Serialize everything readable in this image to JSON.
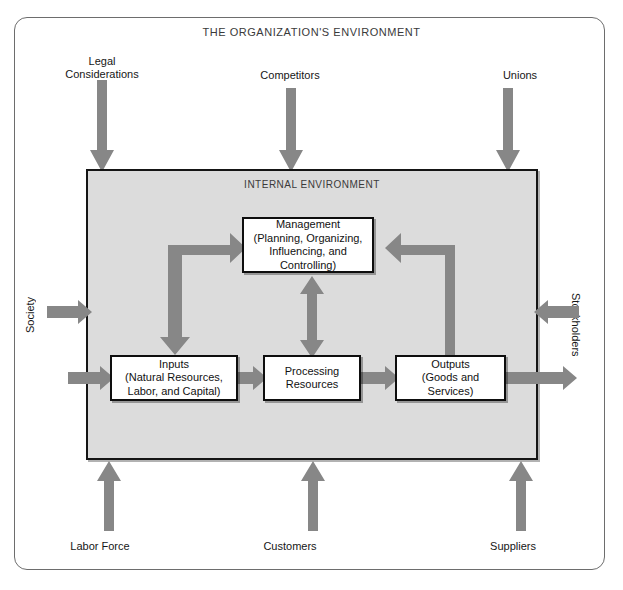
{
  "diagram": {
    "outer_title": "THE ORGANIZATION'S ENVIRONMENT",
    "internal_title": "INTERNAL ENVIRONMENT",
    "colors": {
      "arrow_gray": "#878787",
      "internal_bg": "#dcdcdc",
      "box_bg": "#ffffff",
      "border": "#0e0e0e",
      "frame_border": "#6d6d6d",
      "title_text": "#3a3a3a"
    }
  },
  "internal_boxes": [
    {
      "id": "management",
      "lines": [
        "Management",
        "(Planning, Organizing,",
        "Influencing, and",
        "Controlling)"
      ]
    },
    {
      "id": "inputs",
      "lines": [
        "Inputs",
        "(Natural Resources,",
        "Labor, and Capital)"
      ]
    },
    {
      "id": "processing",
      "lines": [
        "Processing",
        "Resources"
      ]
    },
    {
      "id": "outputs",
      "lines": [
        "Outputs",
        "(Goods and",
        "Services)"
      ]
    }
  ],
  "external_factors": {
    "top": [
      {
        "id": "legal",
        "lines": [
          "Legal",
          "Considerations"
        ],
        "direction": "down"
      },
      {
        "id": "competitors",
        "lines": [
          "Competitors"
        ],
        "direction": "down"
      },
      {
        "id": "unions",
        "lines": [
          "Unions"
        ],
        "direction": "down"
      }
    ],
    "bottom": [
      {
        "id": "labor-force",
        "lines": [
          "Labor Force"
        ],
        "direction": "up"
      },
      {
        "id": "customers",
        "lines": [
          "Customers"
        ],
        "direction": "up"
      },
      {
        "id": "suppliers",
        "lines": [
          "Suppliers"
        ],
        "direction": "up"
      }
    ],
    "left": [
      {
        "id": "society",
        "label": "Society",
        "direction": "right"
      }
    ],
    "right": [
      {
        "id": "stockholders",
        "label": "Stockholders",
        "direction": "left"
      }
    ]
  },
  "flow_arrows": [
    {
      "id": "inputs-to-processing",
      "direction": "right"
    },
    {
      "id": "processing-to-outputs",
      "direction": "right"
    },
    {
      "id": "management-processing-feedback",
      "direction": "both-vertical"
    },
    {
      "id": "inputs-feedback-loop",
      "direction": "elbow-left"
    },
    {
      "id": "outputs-feedback-loop",
      "direction": "elbow-right"
    },
    {
      "id": "outputs-to-environment",
      "direction": "right"
    },
    {
      "id": "society-to-inputs",
      "direction": "right"
    }
  ]
}
